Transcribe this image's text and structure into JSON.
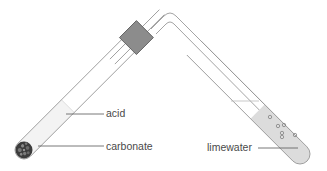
{
  "diagram": {
    "title": "",
    "labels": {
      "acid": "acid",
      "carbonate": "carbonate",
      "limewater": "limewater"
    },
    "colors": {
      "glass": "#9a9a9a",
      "acid_fill": "#f3f3f3",
      "limewater_fill": "#dcdcdc",
      "stopper": "#8c8c8c",
      "carbonate": "#3c3c3c",
      "label_text": "#4a4a4a",
      "leader_line": "#555555"
    },
    "components": [
      "test-tube-acid",
      "rubber-stopper",
      "delivery-tube",
      "test-tube-limewater",
      "carbonate-lumps",
      "gas-bubbles"
    ]
  }
}
